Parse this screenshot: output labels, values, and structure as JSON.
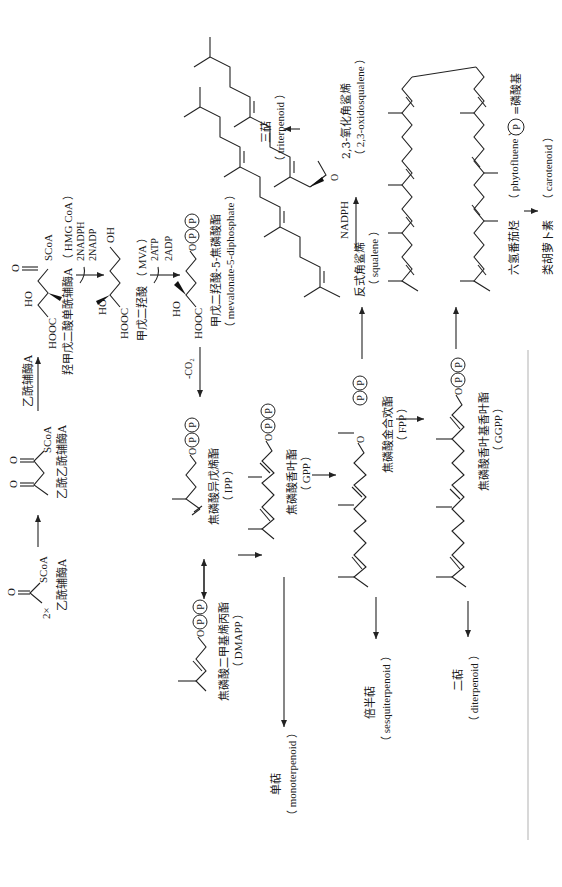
{
  "diagram": {
    "orientation": "rotated 90 degrees counter-clockwise",
    "legend": {
      "symbol": "P",
      "meaning": "=磷酸基"
    },
    "row1": {
      "multiplier": "2×",
      "acetyl_coa": {
        "cn": "乙酰辅酶A",
        "group": "SCoA"
      },
      "acetoacetyl_coa": {
        "cn": "乙酰乙酰辅酶A",
        "group": "SCoA"
      },
      "step_acetylcoa_label": "乙酰辅酶A",
      "hmg_coa": {
        "cn": "羟甲戊二酸单酰辅酶A",
        "en": "（ HMG CoA ）",
        "acid": "HOOC",
        "oh": "HO",
        "group": "SCoA"
      },
      "cofactor1": {
        "in": "2NADPH",
        "out": "2NADP"
      },
      "mva": {
        "cn": "甲戊二羟酸",
        "en": "（ MVA ）",
        "acid": "HOOC",
        "oh": "HO",
        "oh2": "OH"
      },
      "cofactor2": {
        "in": "2ATP",
        "out": "2ADP"
      },
      "mvapp": {
        "cn": "甲戊二羟酸-5-焦磷酸酯",
        "en": "（ mevalonate-5-diphosphate ）",
        "acid": "HOOC",
        "oh": "HO",
        "o": "O"
      },
      "decarboxylation": "-CO₂"
    },
    "row2": {
      "ipp": {
        "cn": "焦磷酸异戊烯酯",
        "en": "（ IPP ）",
        "o": "O"
      },
      "dmapp": {
        "cn": "焦磷酸二甲基烯丙酯",
        "en": "（ DMAPP ）",
        "o": "O"
      },
      "squalene": {
        "cn": "反式角鲨烯",
        "en": "（ squalene ）"
      },
      "nadph": "NADPH",
      "oxidosqualene": {
        "cn": "2,3-氧化角鲨烯",
        "en": "（ 2,3-oxidosqualene ）",
        "o": "O"
      },
      "triterpenoid": {
        "cn": "三萜",
        "en": "（ triterpenoid ）"
      }
    },
    "row3": {
      "gpp": {
        "cn": "焦磷酸香叶酯",
        "en": "（ GPP ）",
        "o": "O"
      },
      "monoterpenoid": {
        "cn": "单萜",
        "en": "（ monoterpenoid ）"
      }
    },
    "row4": {
      "fpp": {
        "cn": "焦磷酸金合欢酯",
        "en": "（ FPP ）",
        "o": "O"
      },
      "sesquiterpenoid": {
        "cn": "倍半萜",
        "en": "（ sesquiterpenoid ）"
      }
    },
    "row5": {
      "ggpp": {
        "cn": "焦磷酸香叶基香叶酯",
        "en": "（ GGPP ）",
        "o": "O"
      },
      "diterpenoid": {
        "cn": "二萜",
        "en": "（ diterpenoid ）"
      },
      "phytofluene": {
        "cn": "六氢番茄烃",
        "en": "（ phytofluene ）"
      },
      "carotenoid": {
        "cn": "类胡萝卜素",
        "en": "（ carotenoid ）"
      }
    },
    "phosphate_symbol": "P",
    "carbonyl_o": "O"
  }
}
